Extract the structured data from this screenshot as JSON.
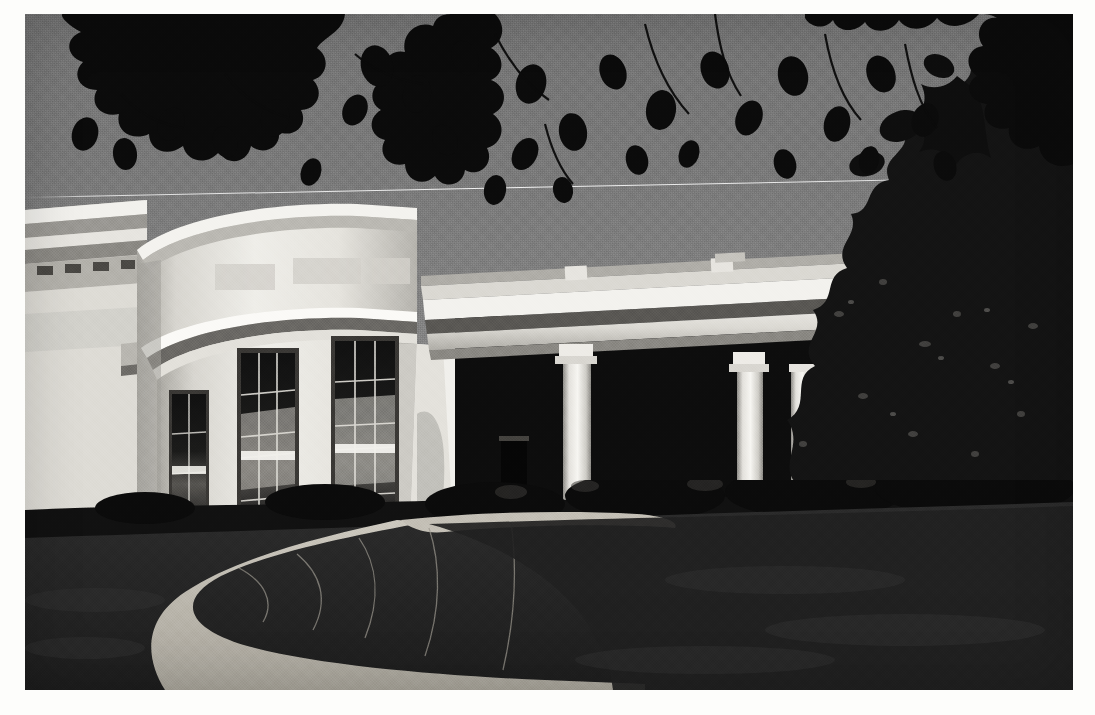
{
  "image": {
    "kind": "photograph",
    "tone": "black-and-white",
    "subject": "White House West Wing Oval Office exterior with colonnade",
    "orientation": "landscape",
    "border_color": "#fdfdfb",
    "frame": {
      "left": 25,
      "top": 14,
      "width": 1048,
      "height": 676
    }
  },
  "palette": {
    "sky": "#7a7a7a",
    "sky_top": "#747474",
    "sky_bottom": "#8a8a8a",
    "wall_lit": "#efeeea",
    "wall_mid": "#d6d4cf",
    "wall_shadow": "#9c9a95",
    "cornice_dark": "#4e4c49",
    "column_lit": "#f4f3ef",
    "column_shade": "#b9b7b2",
    "deep_shadow": "#0c0c0c",
    "foliage_dark": "#111111",
    "lawn_dark": "#242424",
    "lawn_mid": "#3a3a3a",
    "path_light": "#c9c5bb",
    "path_mid": "#a8a49a"
  },
  "regions": [
    {
      "name": "sky",
      "label": "Clear sky"
    },
    {
      "name": "tree-canopy",
      "label": "Overhanging leafy branches, silhouetted"
    },
    {
      "name": "overhead-wire",
      "label": "Thin wire crossing sky"
    },
    {
      "name": "main-building-cornice",
      "label": "West Wing cornice at left edge"
    },
    {
      "name": "oval-office-bow",
      "label": "Curved bow wall of the Oval Office"
    },
    {
      "name": "bow-windows",
      "label": "Three tall multi-pane sash windows with curtains"
    },
    {
      "name": "colonnade-entablature",
      "label": "Flat roof entablature over colonnade"
    },
    {
      "name": "colonnade-columns",
      "label": "Row of white Doric columns receding in perspective"
    },
    {
      "name": "doorway",
      "label": "Dark recessed doorway under colonnade"
    },
    {
      "name": "foundation-shrub",
      "label": "Shrub against white wall casting a shadow"
    },
    {
      "name": "hedge-row",
      "label": "Dark hedge and shrubs along the building base"
    },
    {
      "name": "right-tree-mass",
      "label": "Dense dark trees at right"
    },
    {
      "name": "lawn",
      "label": "Dark mown lawn in foreground"
    },
    {
      "name": "walkway",
      "label": "Pale S-curved paved walkway"
    }
  ],
  "counts": {
    "bow_windows": 3,
    "foreground_columns": 2,
    "receding_columns": 7
  }
}
